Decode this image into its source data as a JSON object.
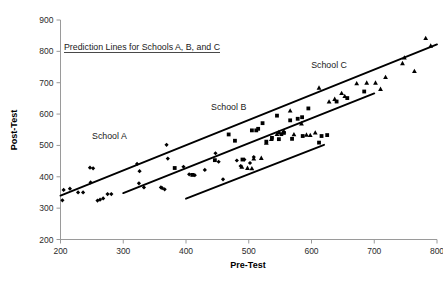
{
  "chart_data": {
    "type": "scatter",
    "title": "Prediction Lines for Schools A, B, and C",
    "xlabel": "Pre-Test",
    "ylabel": "Post-Test",
    "xlim": [
      200,
      800
    ],
    "ylim": [
      200,
      900
    ],
    "xticks": [
      200,
      300,
      400,
      500,
      600,
      700,
      800
    ],
    "yticks": [
      200,
      300,
      400,
      500,
      600,
      700,
      800,
      900
    ],
    "grid": false,
    "legend": "inline-annotations",
    "annotations": [
      {
        "name": "School A",
        "x": 278,
        "y": 520
      },
      {
        "name": "School B",
        "x": 468,
        "y": 614
      },
      {
        "name": "School C",
        "x": 628,
        "y": 748
      }
    ],
    "series": [
      {
        "name": "School A",
        "marker": "diamond",
        "color": "#000000",
        "points": [
          [
            203,
            325
          ],
          [
            205,
            358
          ],
          [
            215,
            362
          ],
          [
            228,
            350
          ],
          [
            236,
            350
          ],
          [
            247,
            429
          ],
          [
            252,
            427
          ],
          [
            248,
            382
          ],
          [
            259,
            324
          ],
          [
            263,
            327
          ],
          [
            268,
            331
          ],
          [
            275,
            345
          ],
          [
            281,
            345
          ],
          [
            322,
            441
          ],
          [
            326,
            418
          ],
          [
            325,
            379
          ],
          [
            333,
            366
          ],
          [
            360,
            366
          ],
          [
            362,
            364
          ],
          [
            366,
            360
          ],
          [
            369,
            502
          ],
          [
            371,
            458
          ],
          [
            396,
            432
          ],
          [
            405,
            408
          ],
          [
            414,
            405
          ],
          [
            430,
            422
          ],
          [
            447,
            475
          ],
          [
            452,
            448
          ],
          [
            459,
            392
          ],
          [
            481,
            452
          ],
          [
            487,
            434
          ],
          [
            493,
            455
          ],
          [
            502,
            444
          ],
          [
            508,
            463
          ]
        ],
        "fit_line": {
          "x1": 200,
          "y1": 340,
          "x2": 800,
          "y2": 822,
          "note": "School A prediction line spans full range"
        }
      },
      {
        "name": "School B",
        "marker": "square",
        "color": "#000000",
        "points": [
          [
            382,
            428
          ],
          [
            410,
            406
          ],
          [
            446,
            453
          ],
          [
            468,
            535
          ],
          [
            478,
            515
          ],
          [
            490,
            455
          ],
          [
            505,
            548
          ],
          [
            512,
            548
          ],
          [
            515,
            553
          ],
          [
            522,
            571
          ],
          [
            528,
            512
          ],
          [
            537,
            524
          ],
          [
            545,
            595
          ],
          [
            548,
            520
          ],
          [
            552,
            536
          ],
          [
            556,
            540
          ],
          [
            566,
            580
          ],
          [
            569,
            521
          ],
          [
            578,
            585
          ],
          [
            585,
            590
          ],
          [
            586,
            530
          ],
          [
            595,
            618
          ],
          [
            612,
            509
          ],
          [
            616,
            530
          ],
          [
            625,
            533
          ],
          [
            640,
            640
          ],
          [
            657,
            651
          ],
          [
            684,
            672
          ]
        ],
        "fit_line": {
          "x1": 300,
          "y1": 348,
          "x2": 700,
          "y2": 666,
          "note": "School B prediction line"
        }
      },
      {
        "name": "School C",
        "marker": "triangle",
        "color": "#000000",
        "points": [
          [
            489,
            432
          ],
          [
            498,
            428
          ],
          [
            505,
            427
          ],
          [
            508,
            458
          ],
          [
            520,
            460
          ],
          [
            528,
            508
          ],
          [
            536,
            520
          ],
          [
            545,
            536
          ],
          [
            548,
            542
          ],
          [
            556,
            545
          ],
          [
            566,
            611
          ],
          [
            572,
            535
          ],
          [
            584,
            570
          ],
          [
            592,
            534
          ],
          [
            598,
            533
          ],
          [
            606,
            541
          ],
          [
            612,
            684
          ],
          [
            628,
            640
          ],
          [
            637,
            648
          ],
          [
            648,
            667
          ],
          [
            653,
            657
          ],
          [
            672,
            698
          ],
          [
            688,
            700
          ],
          [
            702,
            700
          ],
          [
            710,
            680
          ],
          [
            718,
            718
          ],
          [
            745,
            762
          ],
          [
            748,
            780
          ],
          [
            764,
            737
          ],
          [
            782,
            842
          ],
          [
            790,
            818
          ]
        ],
        "fit_line": {
          "x1": 400,
          "y1": 330,
          "x2": 620,
          "y2": 502,
          "note": "School C prediction line (steep segment)"
        }
      }
    ],
    "lines": [
      {
        "label": "line-a",
        "x1": 200,
        "y1": 340,
        "x2": 800,
        "y2": 822
      },
      {
        "label": "line-b",
        "x1": 300,
        "y1": 348,
        "x2": 700,
        "y2": 666
      },
      {
        "label": "line-c",
        "x1": 400,
        "y1": 330,
        "x2": 620,
        "y2": 502
      }
    ]
  }
}
